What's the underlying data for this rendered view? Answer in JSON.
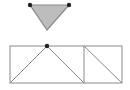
{
  "diagram": {
    "canvas": {
      "width": 130,
      "height": 90,
      "background": "#ffffff"
    },
    "colors": {
      "stroke": "#8a8a8a",
      "fill": "#bdbdbd",
      "dot": "#222222"
    },
    "triangle": {
      "points": [
        [
          30,
          5
        ],
        [
          69,
          5
        ],
        [
          47,
          30
        ]
      ],
      "filled": true,
      "vertex_dots": [
        [
          30,
          5
        ],
        [
          69,
          5
        ]
      ]
    },
    "rectangle": {
      "x": 10,
      "y": 46,
      "width": 112,
      "height": 37,
      "divider_x": 84
    },
    "lines": [
      {
        "from": [
          10,
          83
        ],
        "to": [
          47,
          46
        ]
      },
      {
        "from": [
          47,
          46
        ],
        "to": [
          84,
          83
        ]
      },
      {
        "from": [
          84,
          46
        ],
        "to": [
          122,
          83
        ]
      }
    ],
    "apex_dot": [
      47,
      46
    ]
  }
}
